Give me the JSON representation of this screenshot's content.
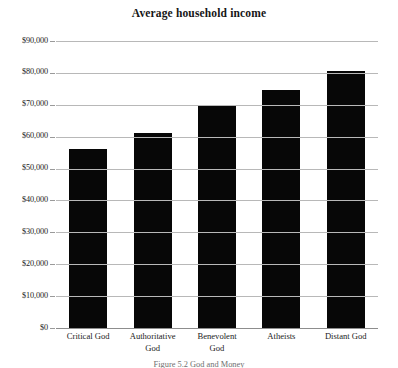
{
  "chart_data": {
    "type": "bar",
    "title": "Average household income",
    "xlabel": "",
    "ylabel": "",
    "categories": [
      "Critical God",
      "Authoritative God",
      "Benevolent God",
      "Atheists",
      "Distant God"
    ],
    "category_lines": [
      [
        "Critical God"
      ],
      [
        "Authoritative",
        "God"
      ],
      [
        "Benevolent",
        "God"
      ],
      [
        "Atheists"
      ],
      [
        "Distant God"
      ]
    ],
    "values": [
      56000,
      61000,
      70000,
      74500,
      80500
    ],
    "ylim": [
      0,
      90000
    ],
    "ytick_values": [
      90000,
      80000,
      70000,
      60000,
      50000,
      40000,
      30000,
      20000,
      10000,
      0
    ],
    "ytick_labels": [
      "$90,000",
      "$80,000",
      "$70,000",
      "$60,000",
      "$50,000",
      "$40,000",
      "$30,000",
      "$20,000",
      "$10,000",
      "$0"
    ],
    "grid": true,
    "legend": false,
    "bar_color": "#070707",
    "grid_color": "#b8b8b8",
    "axis_color": "#8d8d8d"
  },
  "caption": {
    "text": "Figure 5.2  God and Money"
  }
}
